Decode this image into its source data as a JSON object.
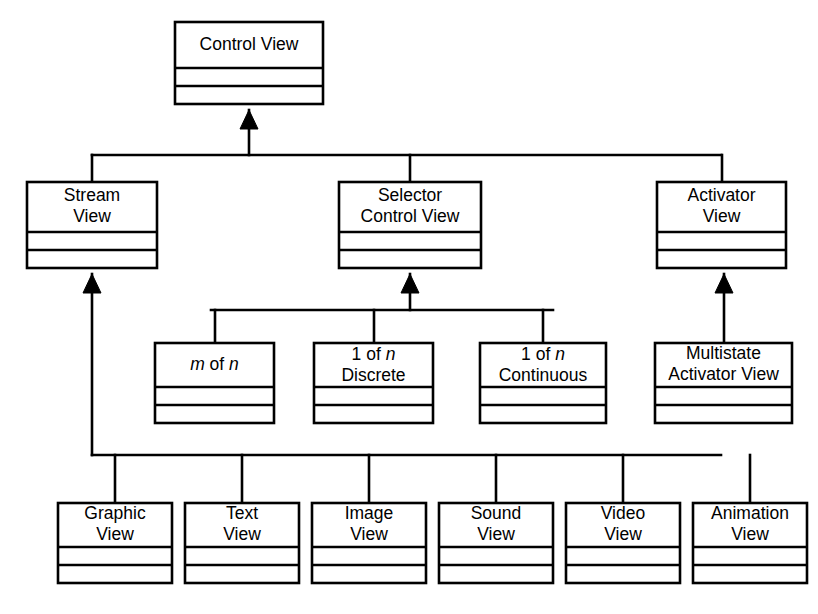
{
  "diagram": {
    "type": "class-hierarchy",
    "colors": {
      "background": "#ffffff",
      "stroke": "#000000",
      "box_fill": "#ffffff",
      "text": "#000000"
    },
    "notation": {
      "arrowhead": "solid-filled-triangle",
      "arrow_direction": "points-to-superclass",
      "box_compartments": 3,
      "line_style": "orthogonal"
    },
    "nodes": [
      {
        "id": "control-view",
        "lines": [
          "Control View"
        ],
        "italic_tokens": [],
        "level": 0,
        "x": 175,
        "y": 22,
        "w": 148,
        "h": 82
      },
      {
        "id": "stream-view",
        "lines": [
          "Stream",
          "View"
        ],
        "italic_tokens": [],
        "level": 1,
        "x": 27,
        "y": 182,
        "w": 130,
        "h": 86
      },
      {
        "id": "selector-control-view",
        "lines": [
          "Selector",
          "Control View"
        ],
        "italic_tokens": [],
        "level": 1,
        "x": 339,
        "y": 182,
        "w": 142,
        "h": 86
      },
      {
        "id": "activator-view",
        "lines": [
          "Activator",
          "View"
        ],
        "italic_tokens": [],
        "level": 1,
        "x": 657,
        "y": 182,
        "w": 129,
        "h": 86
      },
      {
        "id": "m-of-n",
        "lines": [
          "m of n"
        ],
        "italic_tokens": [
          "m",
          "n"
        ],
        "level": 2,
        "x": 155,
        "y": 343,
        "w": 119,
        "h": 80
      },
      {
        "id": "one-of-n-discrete",
        "lines": [
          "1 of n",
          "Discrete"
        ],
        "italic_tokens": [
          "n"
        ],
        "level": 2,
        "x": 314,
        "y": 343,
        "w": 119,
        "h": 80
      },
      {
        "id": "one-of-n-continuous",
        "lines": [
          "1 of n",
          "Continuous"
        ],
        "italic_tokens": [
          "n"
        ],
        "level": 2,
        "x": 480,
        "y": 343,
        "w": 126,
        "h": 80
      },
      {
        "id": "multistate-activator-view",
        "lines": [
          "Multistate",
          "Activator View"
        ],
        "italic_tokens": [],
        "level": 2,
        "x": 655,
        "y": 343,
        "w": 137,
        "h": 80
      },
      {
        "id": "graphic-view",
        "lines": [
          "Graphic",
          "View"
        ],
        "italic_tokens": [],
        "level": 3,
        "x": 58,
        "y": 503,
        "w": 114,
        "h": 80
      },
      {
        "id": "text-view",
        "lines": [
          "Text",
          "View"
        ],
        "italic_tokens": [],
        "level": 3,
        "x": 185,
        "y": 503,
        "w": 114,
        "h": 80
      },
      {
        "id": "image-view",
        "lines": [
          "Image",
          "View"
        ],
        "italic_tokens": [],
        "level": 3,
        "x": 312,
        "y": 503,
        "w": 114,
        "h": 80
      },
      {
        "id": "sound-view",
        "lines": [
          "Sound",
          "View"
        ],
        "italic_tokens": [],
        "level": 3,
        "x": 439,
        "y": 503,
        "w": 114,
        "h": 80
      },
      {
        "id": "video-view",
        "lines": [
          "Video",
          "View"
        ],
        "italic_tokens": [],
        "level": 3,
        "x": 566,
        "y": 503,
        "w": 114,
        "h": 80
      },
      {
        "id": "animation-view",
        "lines": [
          "Animation",
          "View"
        ],
        "italic_tokens": [],
        "level": 3,
        "x": 693,
        "y": 503,
        "w": 114,
        "h": 80
      }
    ],
    "edges": [
      {
        "id": "edge-stream-to-control",
        "from": "stream-view",
        "to": "control-view",
        "kind": "generalization"
      },
      {
        "id": "edge-selector-to-control",
        "from": "selector-control-view",
        "to": "control-view",
        "kind": "generalization"
      },
      {
        "id": "edge-activator-to-control",
        "from": "activator-view",
        "to": "control-view",
        "kind": "generalization"
      },
      {
        "id": "edge-mofn-to-selector",
        "from": "m-of-n",
        "to": "selector-control-view",
        "kind": "generalization"
      },
      {
        "id": "edge-discrete-to-selector",
        "from": "one-of-n-discrete",
        "to": "selector-control-view",
        "kind": "generalization"
      },
      {
        "id": "edge-continuous-to-selector",
        "from": "one-of-n-continuous",
        "to": "selector-control-view",
        "kind": "generalization"
      },
      {
        "id": "edge-multistate-to-activator",
        "from": "multistate-activator-view",
        "to": "activator-view",
        "kind": "generalization"
      },
      {
        "id": "edge-graphic-to-stream",
        "from": "graphic-view",
        "to": "stream-view",
        "kind": "generalization"
      },
      {
        "id": "edge-text-to-stream",
        "from": "text-view",
        "to": "stream-view",
        "kind": "generalization"
      },
      {
        "id": "edge-image-to-stream",
        "from": "image-view",
        "to": "stream-view",
        "kind": "generalization"
      },
      {
        "id": "edge-sound-to-stream",
        "from": "sound-view",
        "to": "stream-view",
        "kind": "generalization"
      },
      {
        "id": "edge-video-to-stream",
        "from": "video-view",
        "to": "stream-view",
        "kind": "generalization"
      },
      {
        "id": "edge-animation-to-stream",
        "from": "animation-view",
        "to": "stream-view",
        "kind": "generalization"
      }
    ],
    "routing": {
      "bus_level1": {
        "y": 155,
        "x1": 92,
        "x2": 721,
        "drop_from": 249,
        "arrow_x": 249
      },
      "bus_level2_selector": {
        "y": 310,
        "x1": 211,
        "x2": 553,
        "arrow_x": 410
      },
      "bus_level3_stream": {
        "y": 455,
        "x1": 92,
        "x2": 721,
        "riser_x": 92
      }
    }
  }
}
